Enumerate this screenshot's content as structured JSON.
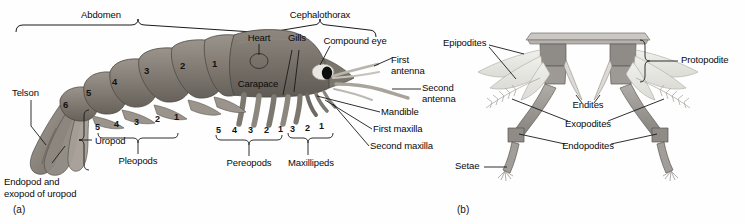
{
  "figure": {
    "background_color": "#fefefe",
    "line_color": "#1a1a1a",
    "text_color": "#0a0a0a",
    "panels": [
      {
        "id": "a",
        "label": "(a)",
        "caption": "Whole-body lateral view"
      },
      {
        "id": "b",
        "label": "(b)",
        "caption": "Biramous appendage detail"
      }
    ]
  },
  "panel_a": {
    "region_brackets": [
      {
        "name": "abdomen",
        "label": "Abdomen"
      },
      {
        "name": "cephalothorax",
        "label": "Cephalothorax"
      }
    ],
    "labels": [
      {
        "name": "telson",
        "text": "Telson"
      },
      {
        "name": "endopod-exopod-of-uropod",
        "text_line1": "Endopod and",
        "text_line2": "exopod of uropod"
      },
      {
        "name": "uropod",
        "text": "Uropod"
      },
      {
        "name": "pleopods",
        "text": "Pleopods"
      },
      {
        "name": "pereopods",
        "text": "Pereopods"
      },
      {
        "name": "maxillipeds",
        "text": "Maxillipeds"
      },
      {
        "name": "heart",
        "text": "Heart"
      },
      {
        "name": "gills",
        "text": "Gills"
      },
      {
        "name": "carapace",
        "text": "Carapace"
      },
      {
        "name": "compound-eye",
        "text": "Compound eye"
      },
      {
        "name": "first-antenna",
        "text_line1": "First",
        "text_line2": "antenna"
      },
      {
        "name": "second-antenna",
        "text_line1": "Second",
        "text_line2": "antenna"
      },
      {
        "name": "mandible",
        "text": "Mandible"
      },
      {
        "name": "first-maxilla",
        "text": "First maxilla"
      },
      {
        "name": "second-maxilla",
        "text": "Second maxilla"
      }
    ],
    "abdominal_segment_numbers": [
      "6",
      "5",
      "4",
      "3",
      "2",
      "1"
    ],
    "pleopod_numbers": [
      "5",
      "4",
      "3",
      "2",
      "1"
    ],
    "pereopod_numbers": [
      "5",
      "4",
      "3",
      "2",
      "1"
    ],
    "maxilliped_numbers": [
      "3",
      "2",
      "1"
    ],
    "colors": {
      "body_dark": "#6f6a63",
      "body_mid": "#8b847b",
      "body_light": "#a9a29a",
      "appendage": "#b9b3ab",
      "eye": "#0d0d0d",
      "antenna": "#c4c0b8"
    }
  },
  "panel_b": {
    "labels": [
      {
        "name": "epipodites",
        "text": "Epipodites"
      },
      {
        "name": "protopodite",
        "text": "Protopodite"
      },
      {
        "name": "endites",
        "text": "Endites"
      },
      {
        "name": "exopodites",
        "text": "Exopodites"
      },
      {
        "name": "endopodites",
        "text": "Endopodites"
      },
      {
        "name": "setae",
        "text": "Setae"
      }
    ],
    "colors": {
      "limb_dark": "#85817c",
      "limb_mid": "#9d9994",
      "limb_light": "#c8c5c0",
      "plume": "#e6e6e2"
    }
  }
}
